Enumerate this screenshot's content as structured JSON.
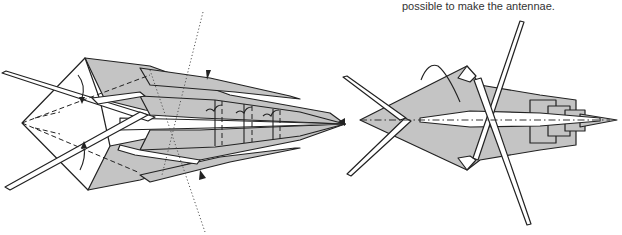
{
  "caption": {
    "text": "possible to make the antennae."
  },
  "diagrams": [
    {
      "id": "step-left",
      "description": "Origami insect body with crossed antennae strips, valley-fold dashed lines, curved fold arrows, dotted reference line, and pleat markings along the tail",
      "symbols": [
        "valley-fold-line",
        "x-ray-dotted-line",
        "fold-arrow",
        "pleat-arrow",
        "push-arrowhead"
      ]
    },
    {
      "id": "step-right",
      "description": "Result: insect with crossed antennae, stepped pleated abdomen, and dash-dot center crease",
      "symbols": [
        "dash-dot-line",
        "turn-over-arrow"
      ]
    }
  ],
  "colors": {
    "paper_shade": "#c4c4c4",
    "paper_white": "#ffffff",
    "line": "#222222"
  }
}
